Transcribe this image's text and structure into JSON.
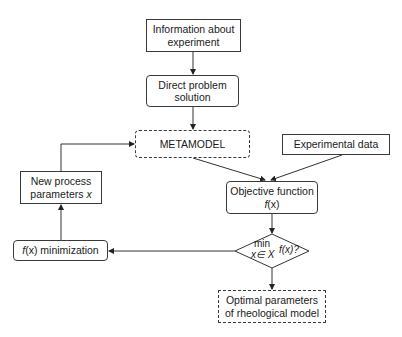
{
  "diagram": {
    "nodes": {
      "info": {
        "line1": "Information about",
        "line2": "experiment"
      },
      "direct": {
        "line1": "Direct problem",
        "line2": "solution"
      },
      "metamodel": {
        "label": "METAMODEL"
      },
      "experimental": {
        "label": "Experimental data"
      },
      "objective": {
        "line1": "Objective function",
        "line2_func": "f",
        "line2_arg": "(x)"
      },
      "decision": {
        "min": "min",
        "sub": "x∈ X",
        "expr": "f(x)?"
      },
      "optimal": {
        "line1": "Optimal parameters",
        "line2": "of rheological model"
      },
      "new_params": {
        "line1": "New process",
        "line2_text": "parameters ",
        "line2_var": "x"
      },
      "minimization": {
        "func": "f",
        "arg": "(x)",
        "text": " minimization"
      }
    },
    "edges": [
      {
        "from": "info",
        "to": "direct"
      },
      {
        "from": "direct",
        "to": "metamodel"
      },
      {
        "from": "metamodel",
        "to": "objective"
      },
      {
        "from": "experimental",
        "to": "objective"
      },
      {
        "from": "objective",
        "to": "decision"
      },
      {
        "from": "decision",
        "to": "optimal"
      },
      {
        "from": "decision",
        "to": "minimization"
      },
      {
        "from": "minimization",
        "to": "new_params"
      },
      {
        "from": "new_params",
        "to": "metamodel"
      }
    ]
  }
}
